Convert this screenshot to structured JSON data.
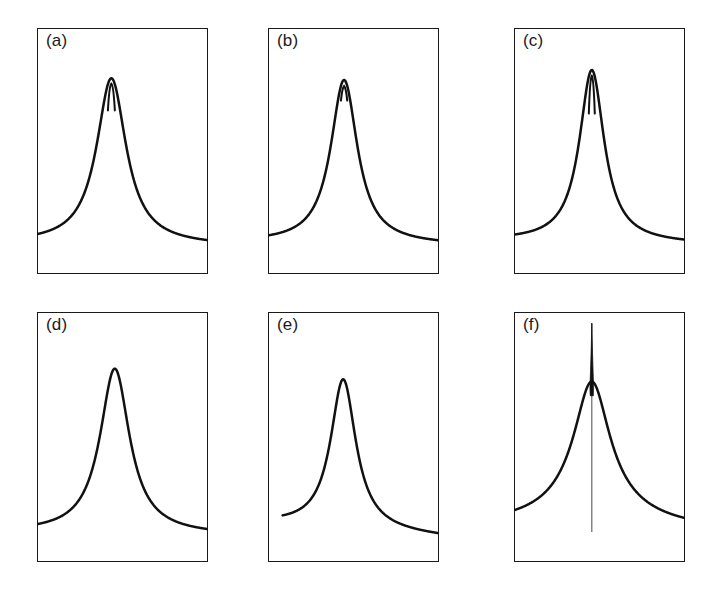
{
  "figure": {
    "background_color": "#ffffff",
    "ink_color": "#111111",
    "frame_color": "#1a1a1a",
    "width": 716,
    "height": 593,
    "columns": 3,
    "rows": 2
  },
  "chart_data": {
    "type": "line",
    "title": "",
    "xlabel": "",
    "ylabel": "",
    "grid": false,
    "legend": false,
    "axis_ticks": false,
    "axis_tick_labels": false,
    "panels": [
      {
        "label": "(a)",
        "name": "panel-a",
        "frame": {
          "x": 37,
          "y": 28,
          "width": 171,
          "height": 246
        },
        "baseline_y": 0.875,
        "peak_center_x": 0.435,
        "peak_height": 0.675,
        "peak_halfwidth": 0.105,
        "wing_exponent": 1.0,
        "left_baseline_y": 0.875,
        "right_baseline_y": 0.885,
        "notch": {
          "present": true,
          "width": 0.022,
          "depth": 0.105,
          "style": "slit"
        },
        "spike": {
          "present": false
        },
        "curve_style": "lorentzian-notched"
      },
      {
        "label": "(b)",
        "name": "panel-b",
        "frame": {
          "x": 268,
          "y": 28,
          "width": 171,
          "height": 246
        },
        "baseline_y": 0.875,
        "peak_center_x": 0.445,
        "peak_height": 0.665,
        "peak_halfwidth": 0.095,
        "wing_exponent": 1.0,
        "left_baseline_y": 0.872,
        "right_baseline_y": 0.882,
        "notch": {
          "present": true,
          "width": 0.02,
          "depth": 0.055,
          "style": "slit"
        },
        "spike": {
          "present": false
        },
        "curve_style": "lorentzian-notched"
      },
      {
        "label": "(c)",
        "name": "panel-c",
        "frame": {
          "x": 514,
          "y": 28,
          "width": 171,
          "height": 246
        },
        "baseline_y": 0.868,
        "peak_center_x": 0.455,
        "peak_height": 0.7,
        "peak_halfwidth": 0.088,
        "wing_exponent": 1.0,
        "left_baseline_y": 0.865,
        "right_baseline_y": 0.878,
        "notch": {
          "present": true,
          "width": 0.019,
          "depth": 0.15,
          "style": "slit-deep"
        },
        "spike": {
          "present": false
        },
        "curve_style": "lorentzian-notched"
      },
      {
        "label": "(d)",
        "name": "panel-d",
        "frame": {
          "x": 37,
          "y": 312,
          "width": 171,
          "height": 250
        },
        "baseline_y": 0.885,
        "peak_center_x": 0.455,
        "peak_height": 0.66,
        "peak_halfwidth": 0.105,
        "wing_exponent": 1.0,
        "left_baseline_y": 0.882,
        "right_baseline_y": 0.892,
        "notch": {
          "present": false
        },
        "spike": {
          "present": false
        },
        "curve_style": "lorentzian-smooth"
      },
      {
        "label": "(e)",
        "name": "panel-e",
        "frame": {
          "x": 268,
          "y": 312,
          "width": 171,
          "height": 250
        },
        "baseline_y": 0.89,
        "peak_center_x": 0.44,
        "peak_height": 0.6,
        "peak_halfwidth": 0.09,
        "wing_exponent": 1.0,
        "left_baseline_y": 0.845,
        "right_baseline_y": 0.9,
        "notch": {
          "present": false
        },
        "spike": {
          "present": false
        },
        "curve_style": "lorentzian-asymmetric"
      },
      {
        "label": "(f)",
        "name": "panel-f",
        "frame": {
          "x": 514,
          "y": 312,
          "width": 171,
          "height": 250
        },
        "baseline_y": 0.88,
        "peak_center_x": 0.455,
        "peak_height": 0.6,
        "peak_halfwidth": 0.115,
        "wing_exponent": 0.72,
        "left_baseline_y": 0.872,
        "right_baseline_y": 0.886,
        "notch": {
          "present": false
        },
        "spike": {
          "present": true,
          "height": 0.235,
          "width": 0.016,
          "tail_to_baseline": true
        },
        "curve_style": "cusp-spiked"
      }
    ]
  }
}
